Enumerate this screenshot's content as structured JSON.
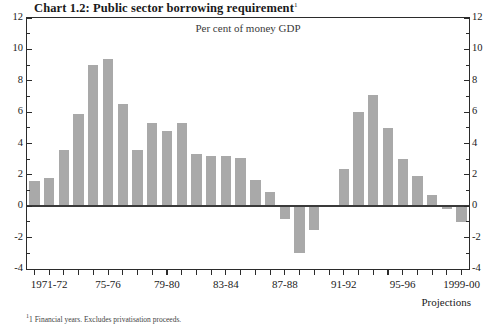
{
  "chart_data": {
    "type": "bar",
    "title": "Chart 1.2: Public sector borrowing requirement",
    "title_footnote_marker": "1",
    "subtitle": "Per cent of money GDP",
    "xlabel": "",
    "ylabel": "",
    "ylim": [
      -4,
      12
    ],
    "y_major_step": 2,
    "y_minor_step": 1,
    "grid": false,
    "legend": null,
    "bar_color": "#a9a9a9",
    "axis_color": "#2b2b2b",
    "categories": [
      "1970-71",
      "1971-72",
      "1972-73",
      "1973-74",
      "1974-75",
      "1975-76",
      "1976-77",
      "1977-78",
      "1978-79",
      "1979-80",
      "1980-81",
      "1981-82",
      "1982-83",
      "1983-84",
      "1984-85",
      "1985-86",
      "1986-87",
      "1987-88",
      "1988-89",
      "1989-90",
      "1990-91",
      "1991-92",
      "1992-93",
      "1993-94",
      "1994-95",
      "1995-96",
      "1996-97",
      "1997-98",
      "1998-99",
      "1999-00"
    ],
    "values": [
      1.6,
      1.8,
      3.6,
      5.9,
      9.0,
      9.4,
      6.5,
      3.6,
      5.3,
      4.8,
      5.3,
      3.3,
      3.2,
      3.2,
      3.1,
      1.7,
      0.9,
      -0.8,
      -3.0,
      -1.5,
      0.1,
      2.4,
      6.0,
      7.1,
      5.0,
      3.0,
      1.9,
      0.7,
      -0.2,
      -1.0
    ],
    "y_ticks": [
      -4,
      -2,
      0,
      2,
      4,
      6,
      8,
      10,
      12
    ],
    "y_tick_labels_left": [
      "-4",
      "-2",
      "0",
      "2",
      "4",
      "6",
      "8",
      "10",
      "12"
    ],
    "y_tick_labels_right": [
      "-4",
      "-2",
      "0",
      "2",
      "4",
      "6",
      "8",
      "10",
      "12"
    ],
    "x_tick_labels": [
      {
        "label": "1971-72",
        "index": 1
      },
      {
        "label": "75-76",
        "index": 5
      },
      {
        "label": "79-80",
        "index": 9
      },
      {
        "label": "83-84",
        "index": 13
      },
      {
        "label": "87-88",
        "index": 17
      },
      {
        "label": "91-92",
        "index": 21
      },
      {
        "label": "95-96",
        "index": 25
      },
      {
        "label": "1999-00",
        "index": 29
      }
    ],
    "annotations": [
      {
        "name": "projections-note",
        "text": "Projections"
      }
    ],
    "footnote": "1 Financial years. Excludes privatisation proceeds."
  }
}
